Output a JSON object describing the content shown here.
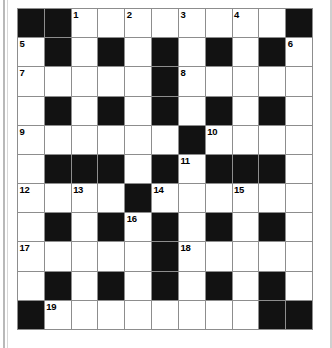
{
  "puzzle": {
    "title": "Crossword Grid",
    "type": "crossword",
    "rows": 11,
    "cols": 11,
    "colors": {
      "block": "#121212",
      "cell": "#ffffff",
      "grid_line": "#8d8d8d",
      "number_text": "#000000",
      "page_background": "#ffffff"
    },
    "legend": {
      "block_char": "#",
      "open_char": "."
    },
    "grid": [
      "##.........#",
      ".#.#.#.#.#.",
      ".....#.....",
      ".#.#.#.#.#.",
      "......#....",
      ".###.#.###.",
      "....#......",
      ".#.#.#.#.#.",
      ".....#.....",
      ".#.#.#.#.#.",
      "#........##"
    ],
    "grid_rows": [
      [
        "black",
        "black",
        "open",
        "open",
        "open",
        "open",
        "open",
        "open",
        "open",
        "open",
        "black"
      ],
      [
        "open",
        "black",
        "open",
        "black",
        "open",
        "black",
        "open",
        "black",
        "open",
        "black",
        "open"
      ],
      [
        "open",
        "open",
        "open",
        "open",
        "open",
        "black",
        "open",
        "open",
        "open",
        "open",
        "open"
      ],
      [
        "open",
        "black",
        "open",
        "black",
        "open",
        "black",
        "open",
        "black",
        "open",
        "black",
        "open"
      ],
      [
        "open",
        "open",
        "open",
        "open",
        "open",
        "open",
        "black",
        "open",
        "open",
        "open",
        "open"
      ],
      [
        "open",
        "black",
        "black",
        "black",
        "open",
        "black",
        "open",
        "black",
        "black",
        "black",
        "open"
      ],
      [
        "open",
        "open",
        "open",
        "open",
        "black",
        "open",
        "open",
        "open",
        "open",
        "open",
        "open"
      ],
      [
        "open",
        "black",
        "open",
        "black",
        "open",
        "black",
        "open",
        "black",
        "open",
        "black",
        "open"
      ],
      [
        "open",
        "open",
        "open",
        "open",
        "open",
        "black",
        "open",
        "open",
        "open",
        "open",
        "open"
      ],
      [
        "open",
        "black",
        "open",
        "black",
        "open",
        "black",
        "open",
        "black",
        "open",
        "black",
        "open"
      ],
      [
        "black",
        "open",
        "open",
        "open",
        "open",
        "open",
        "open",
        "open",
        "open",
        "black",
        "black"
      ]
    ],
    "numbers": [
      {
        "label": "1",
        "row": 0,
        "col": 2
      },
      {
        "label": "2",
        "row": 0,
        "col": 4
      },
      {
        "label": "3",
        "row": 0,
        "col": 6
      },
      {
        "label": "4",
        "row": 0,
        "col": 8
      },
      {
        "label": "5",
        "row": 1,
        "col": 0
      },
      {
        "label": "6",
        "row": 1,
        "col": 10
      },
      {
        "label": "7",
        "row": 2,
        "col": 0
      },
      {
        "label": "8",
        "row": 2,
        "col": 6
      },
      {
        "label": "9",
        "row": 4,
        "col": 0
      },
      {
        "label": "10",
        "row": 4,
        "col": 7
      },
      {
        "label": "11",
        "row": 5,
        "col": 6
      },
      {
        "label": "12",
        "row": 6,
        "col": 0
      },
      {
        "label": "13",
        "row": 6,
        "col": 2
      },
      {
        "label": "14",
        "row": 6,
        "col": 5
      },
      {
        "label": "15",
        "row": 6,
        "col": 8
      },
      {
        "label": "16",
        "row": 7,
        "col": 4
      },
      {
        "label": "17",
        "row": 8,
        "col": 0
      },
      {
        "label": "18",
        "row": 8,
        "col": 6
      },
      {
        "label": "19",
        "row": 10,
        "col": 1
      }
    ]
  }
}
